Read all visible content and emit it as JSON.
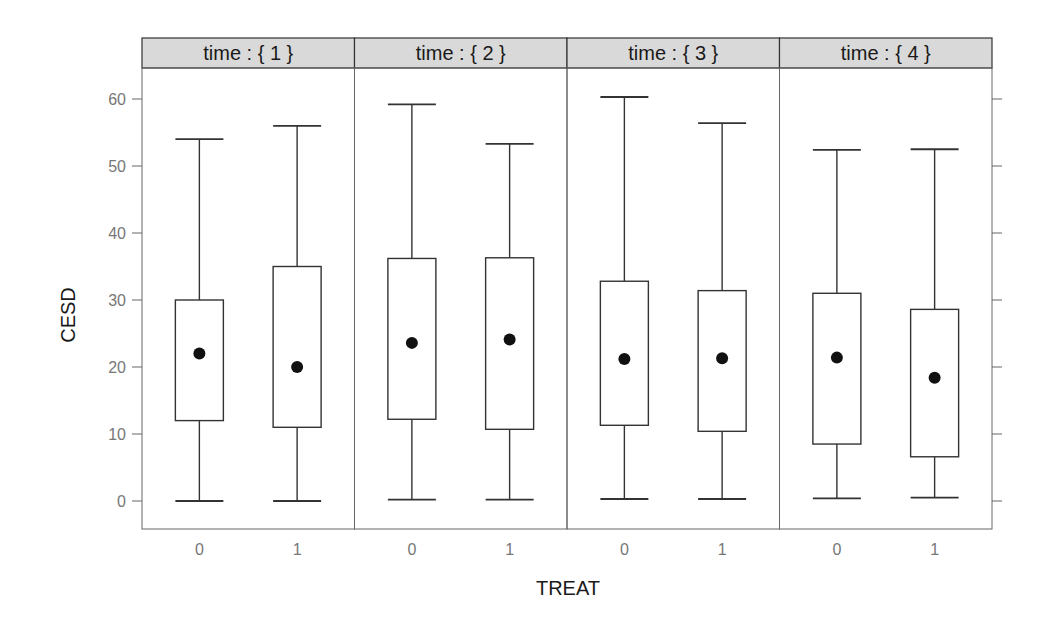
{
  "chart_data": {
    "type": "boxplot",
    "title": "",
    "xlabel": "TREAT",
    "ylabel": "CESD",
    "ylim": [
      -4,
      64
    ],
    "yticks": [
      0,
      10,
      20,
      30,
      40,
      50,
      60
    ],
    "grid": false,
    "legend": null,
    "facet_variable": "time",
    "panels": [
      {
        "strip_label": "time : { 1 }",
        "categories": [
          "0",
          "1"
        ],
        "boxes": [
          {
            "treat": "0",
            "whisker_low": 0,
            "q1": 12,
            "median": 22,
            "q3": 30,
            "whisker_high": 54
          },
          {
            "treat": "1",
            "whisker_low": 0,
            "q1": 11,
            "median": 20,
            "q3": 35,
            "whisker_high": 56
          }
        ]
      },
      {
        "strip_label": "time : { 2 }",
        "categories": [
          "0",
          "1"
        ],
        "boxes": [
          {
            "treat": "0",
            "whisker_low": 0.2,
            "q1": 12.2,
            "median": 23.6,
            "q3": 36.2,
            "whisker_high": 59.2
          },
          {
            "treat": "1",
            "whisker_low": 0.2,
            "q1": 10.7,
            "median": 24.1,
            "q3": 36.3,
            "whisker_high": 53.3
          }
        ]
      },
      {
        "strip_label": "time : { 3 }",
        "categories": [
          "0",
          "1"
        ],
        "boxes": [
          {
            "treat": "0",
            "whisker_low": 0.3,
            "q1": 11.3,
            "median": 21.2,
            "q3": 32.8,
            "whisker_high": 60.3
          },
          {
            "treat": "1",
            "whisker_low": 0.3,
            "q1": 10.4,
            "median": 21.3,
            "q3": 31.4,
            "whisker_high": 56.4
          }
        ]
      },
      {
        "strip_label": "time : { 4 }",
        "categories": [
          "0",
          "1"
        ],
        "boxes": [
          {
            "treat": "0",
            "whisker_low": 0.4,
            "q1": 8.5,
            "median": 21.4,
            "q3": 31.0,
            "whisker_high": 52.4
          },
          {
            "treat": "1",
            "whisker_low": 0.5,
            "q1": 6.6,
            "median": 18.4,
            "q3": 28.6,
            "whisker_high": 52.5
          }
        ]
      }
    ]
  },
  "colors": {
    "strip_bg": "#d9d9d9",
    "frame": "#666666",
    "box_line": "#333333",
    "median_dot": "#111111",
    "tick_text": "#777777"
  }
}
